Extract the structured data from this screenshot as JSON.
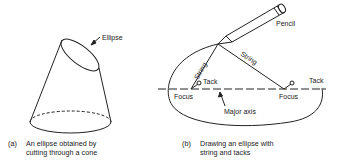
{
  "panel_a": {
    "labels": {
      "ellipse": "Ellipse"
    },
    "caption": {
      "tag": "(a)",
      "line1": "An ellipse obtained by",
      "line2": "cutting through a cone"
    }
  },
  "panel_b": {
    "labels": {
      "pencil": "Pencil",
      "string_left": "String",
      "string_right": "String",
      "tack_left": "Tack",
      "tack_right": "Tack",
      "focus_left": "Focus",
      "focus_right": "Focus",
      "major_axis": "Major axis"
    },
    "caption": {
      "tag": "(b)",
      "line1": "Drawing an ellipse with",
      "line2": "string and tacks"
    }
  }
}
